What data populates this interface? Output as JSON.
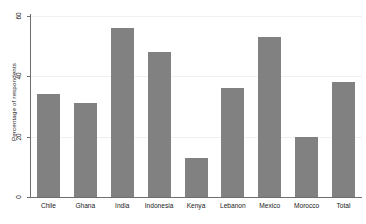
{
  "chart_data": {
    "type": "bar",
    "title": "",
    "subtitle": "",
    "xlabel": "",
    "ylabel": "Percentage of respondents",
    "categories": [
      "Chile",
      "Ghana",
      "India",
      "Indonesia",
      "Kenya",
      "Lebanon",
      "Mexico",
      "Morocco",
      "Total"
    ],
    "values": [
      34,
      31,
      56,
      48,
      13,
      36,
      53,
      20,
      38
    ],
    "ylim": [
      0,
      60
    ],
    "yticks": [
      0,
      20,
      40,
      60
    ],
    "ytick_labels": [
      "0",
      "20",
      "40",
      "60"
    ],
    "grid": true,
    "grid_axis": "y",
    "legend": false,
    "legend_position": "none",
    "bar_color": "#818181",
    "axis_color": "#6e6e6e",
    "gridline_color": "#f0f0f0",
    "background_color": "#ffffff",
    "series": [
      {
        "name": "Percentage of respondents",
        "values": [
          34,
          31,
          56,
          48,
          13,
          36,
          53,
          20,
          38
        ]
      }
    ]
  }
}
